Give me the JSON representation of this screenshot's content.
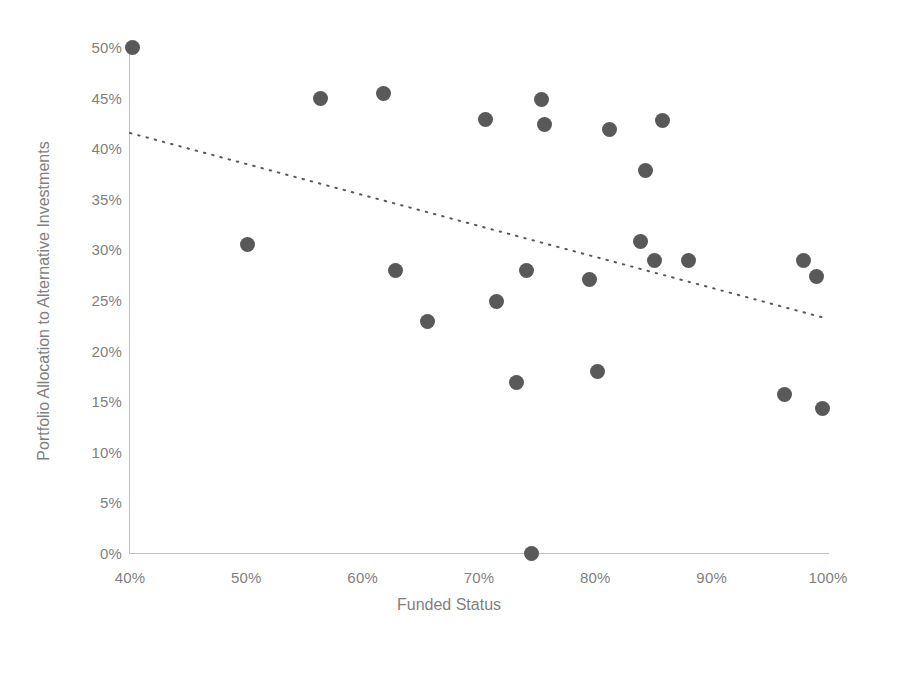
{
  "chart_data": {
    "type": "scatter",
    "title": "",
    "xlabel": "Funded Status",
    "ylabel": "Portfolio Allocation to Alternative Investments",
    "xlim": [
      40,
      100
    ],
    "ylim": [
      0,
      50
    ],
    "grid": false,
    "legend": false,
    "x_ticks": [
      "40%",
      "50%",
      "60%",
      "70%",
      "80%",
      "90%",
      "100%"
    ],
    "x_tick_values": [
      40,
      50,
      60,
      70,
      80,
      90,
      100
    ],
    "y_ticks": [
      "0%",
      "5%",
      "10%",
      "15%",
      "20%",
      "25%",
      "30%",
      "35%",
      "40%",
      "45%",
      "50%"
    ],
    "y_tick_values": [
      0,
      5,
      10,
      15,
      20,
      25,
      30,
      35,
      40,
      45,
      50
    ],
    "marker_color": "#595959",
    "marker_size_px": 15,
    "axis_color": "#bfbfbf",
    "tick_label_color": "#7f7f7f",
    "series": [
      {
        "name": "Plans",
        "points": [
          {
            "x": 40.2,
            "y": 50.0
          },
          {
            "x": 50.1,
            "y": 30.5
          },
          {
            "x": 56.4,
            "y": 44.9
          },
          {
            "x": 61.8,
            "y": 45.4
          },
          {
            "x": 62.8,
            "y": 27.9
          },
          {
            "x": 65.6,
            "y": 22.9
          },
          {
            "x": 70.6,
            "y": 42.8
          },
          {
            "x": 71.5,
            "y": 24.9
          },
          {
            "x": 73.2,
            "y": 16.8
          },
          {
            "x": 74.1,
            "y": 27.9
          },
          {
            "x": 74.5,
            "y": 0.0
          },
          {
            "x": 75.4,
            "y": 44.8
          },
          {
            "x": 75.6,
            "y": 42.3
          },
          {
            "x": 79.5,
            "y": 27.0
          },
          {
            "x": 80.2,
            "y": 17.9
          },
          {
            "x": 81.2,
            "y": 41.8
          },
          {
            "x": 83.9,
            "y": 30.8
          },
          {
            "x": 84.3,
            "y": 37.8
          },
          {
            "x": 85.1,
            "y": 28.9
          },
          {
            "x": 85.8,
            "y": 42.7
          },
          {
            "x": 88.0,
            "y": 28.9
          },
          {
            "x": 96.3,
            "y": 15.7
          },
          {
            "x": 97.9,
            "y": 28.9
          },
          {
            "x": 99.0,
            "y": 27.3
          },
          {
            "x": 99.5,
            "y": 14.3
          }
        ]
      }
    ],
    "trendline": {
      "style": "dotted",
      "color": "#595959",
      "x_start": 40.0,
      "y_start": 41.5,
      "x_end": 99.8,
      "y_end": 23.2
    }
  }
}
